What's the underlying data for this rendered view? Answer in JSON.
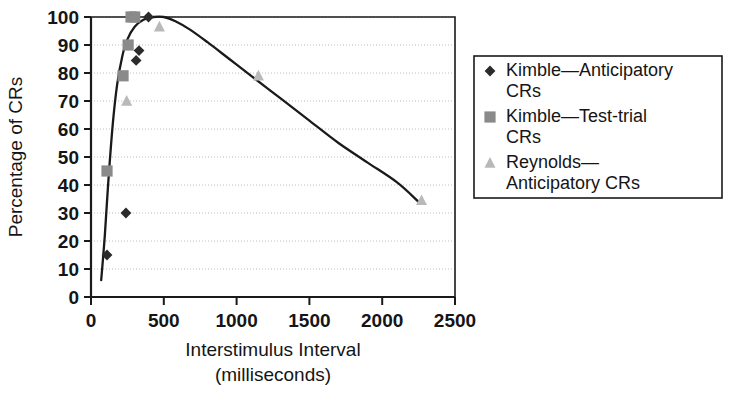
{
  "chart_data": {
    "type": "scatter",
    "title": "",
    "xlabel": "Interstimulus Interval (milliseconds)",
    "xlabel_line1": "Interstimulus Interval",
    "xlabel_line2": "(milliseconds)",
    "ylabel": "Percentage of CRs",
    "xlim": [
      0,
      2500
    ],
    "ylim": [
      0,
      100
    ],
    "xticks": [
      0,
      500,
      1000,
      1500,
      2000,
      2500
    ],
    "xtick_labels": [
      "0",
      "500",
      "1000",
      "1500",
      "2000",
      "2500"
    ],
    "yticks": [
      0,
      10,
      20,
      30,
      40,
      50,
      60,
      70,
      80,
      90,
      100
    ],
    "ytick_labels": [
      "0",
      "10",
      "20",
      "30",
      "40",
      "50",
      "60",
      "70",
      "80",
      "90",
      "100"
    ],
    "grid": "horizontal-dotted",
    "legend_position": "right-outside",
    "series": [
      {
        "name": "Kimble—Anticipatory CRs",
        "marker": "diamond",
        "color": "#2b2b2b",
        "points": [
          {
            "x": 110,
            "y": 15
          },
          {
            "x": 240,
            "y": 30
          },
          {
            "x": 310,
            "y": 84.5
          },
          {
            "x": 330,
            "y": 88
          },
          {
            "x": 395,
            "y": 100
          }
        ]
      },
      {
        "name": "Kimble—Test-trial CRs",
        "marker": "square",
        "color": "#8a8a8a",
        "points": [
          {
            "x": 110,
            "y": 45
          },
          {
            "x": 220,
            "y": 79
          },
          {
            "x": 255,
            "y": 90
          },
          {
            "x": 275,
            "y": 100
          },
          {
            "x": 300,
            "y": 100
          }
        ]
      },
      {
        "name": "Reynolds—Anticipatory CRs",
        "marker": "triangle",
        "color": "#b9b9b9",
        "points": [
          {
            "x": 245,
            "y": 70
          },
          {
            "x": 470,
            "y": 96.5
          },
          {
            "x": 1150,
            "y": 79
          },
          {
            "x": 2270,
            "y": 34.5
          }
        ]
      }
    ],
    "fit_curve": {
      "name": "fitted-trend-curve",
      "color": "#1a1a1a",
      "points": [
        {
          "x": 70,
          "y": 6
        },
        {
          "x": 95,
          "y": 22
        },
        {
          "x": 120,
          "y": 42
        },
        {
          "x": 150,
          "y": 62
        },
        {
          "x": 180,
          "y": 76
        },
        {
          "x": 215,
          "y": 86
        },
        {
          "x": 250,
          "y": 92
        },
        {
          "x": 300,
          "y": 96.5
        },
        {
          "x": 360,
          "y": 99
        },
        {
          "x": 430,
          "y": 100
        },
        {
          "x": 500,
          "y": 100
        },
        {
          "x": 580,
          "y": 98.5
        },
        {
          "x": 680,
          "y": 95.5
        },
        {
          "x": 800,
          "y": 91
        },
        {
          "x": 950,
          "y": 85
        },
        {
          "x": 1100,
          "y": 79
        },
        {
          "x": 1300,
          "y": 71
        },
        {
          "x": 1500,
          "y": 63
        },
        {
          "x": 1700,
          "y": 55
        },
        {
          "x": 1900,
          "y": 48
        },
        {
          "x": 2100,
          "y": 41
        },
        {
          "x": 2250,
          "y": 34
        }
      ]
    }
  },
  "legend": {
    "entries": [
      {
        "label_line1": "Kimble—Anticipatory",
        "label_line2": "CRs",
        "marker": "diamond"
      },
      {
        "label_line1": "Kimble—Test-trial",
        "label_line2": "CRs",
        "marker": "square"
      },
      {
        "label_line1": "Reynolds—",
        "label_line2": "Anticipatory CRs",
        "marker": "triangle"
      }
    ]
  },
  "colors": {
    "series1": "#2b2b2b",
    "series2": "#8a8a8a",
    "series3": "#b9b9b9",
    "curve": "#1a1a1a",
    "axis": "#1a1a1a",
    "grid": "#bcbcbc",
    "background": "#ffffff"
  }
}
